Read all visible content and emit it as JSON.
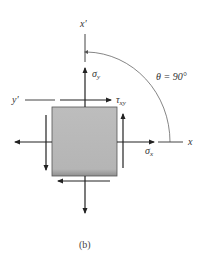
{
  "figure": {
    "caption": "(b)",
    "angle_label": "θ = 90°",
    "axes": {
      "x": "x",
      "x_prime": "x′",
      "y_prime": "y′"
    },
    "stresses": {
      "sigma_y": {
        "symbol": "σ",
        "subscript": "y"
      },
      "sigma_x": {
        "symbol": "σ",
        "subscript": "x"
      },
      "tau_xy": {
        "symbol": "τ",
        "subscript": "xy"
      }
    },
    "colors": {
      "element_fill": "#b8b8b8",
      "line": "#222222",
      "arc": "#555555"
    }
  }
}
